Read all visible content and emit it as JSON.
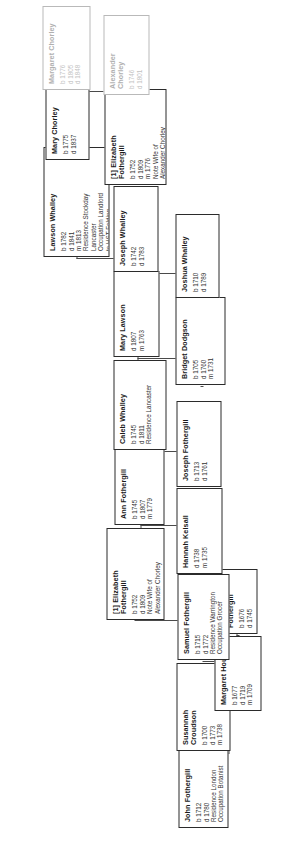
{
  "chart": {
    "type": "genealogy-family-tree",
    "orientation": "rotated-90-ccw"
  },
  "nodes": [
    {
      "id": "john-fothergill-1712",
      "name": "John Fothergill",
      "facts": "b  1712\nd  1780\nResidence  London\nOccupation  Botanist",
      "faded": false,
      "x": 22,
      "y": 178,
      "w": 86,
      "h": 50
    },
    {
      "id": "susannah-croudson",
      "name": "Susannah\nCroudson",
      "facts": "b  1700\nd  1773\nm  1738",
      "faded": false,
      "x": 99,
      "y": 176,
      "w": 88,
      "h": 54
    },
    {
      "id": "margaret-hough",
      "name": "Margaret Hough",
      "facts": "b  1677\nd  1719\nm  1709",
      "faded": false,
      "x": 139,
      "y": 214,
      "w": 75,
      "h": 47
    },
    {
      "id": "john-fothergill-1676",
      "name": "John Fothergill",
      "facts": "b  1676\nd  1745",
      "faded": false,
      "x": 216,
      "y": 213,
      "w": 65,
      "h": 44
    },
    {
      "id": "samuel-fothergill",
      "name": "Samuel Fothergill",
      "facts": "b  1715\nd  1772\nResidence  Warrington\nOccupation  Grocer",
      "faded": false,
      "x": 190,
      "y": 177,
      "w": 86,
      "h": 52
    },
    {
      "id": "elizabeth-fothergill-1752",
      "name": "[1] Elizabeth\nFothergill",
      "facts": "b  1752\nd  1809\nNote  Wife of\nAlexander Chorley",
      "faded": false,
      "x": 230,
      "y": 106,
      "w": 92,
      "h": 58
    },
    {
      "id": "hannah-kelsall",
      "name": "Hannah Kelsall",
      "facts": "d  1738\nm  1735",
      "faded": false,
      "x": 276,
      "y": 176,
      "w": 86,
      "h": 46
    },
    {
      "id": "joseph-fothergill-1713",
      "name": "Joseph Fothergill",
      "facts": "b  1713\nd  1761",
      "faded": false,
      "x": 363,
      "y": 176,
      "w": 86,
      "h": 45
    },
    {
      "id": "ann-fothergill",
      "name": "Ann Fothergill",
      "facts": "b  1745\nd  1807\nm  1779",
      "faded": false,
      "x": 325,
      "y": 114,
      "w": 85,
      "h": 50
    },
    {
      "id": "caleb-whalley",
      "name": "Caleb Whalley",
      "facts": "b  1745\nd  1811\nResidence  Lancaster",
      "faded": false,
      "x": 400,
      "y": 113,
      "w": 90,
      "h": 53
    },
    {
      "id": "bridget-dodgson",
      "name": "Bridget Dodgson",
      "facts": "b  1705\nd  1760\nm  1731",
      "faded": false,
      "x": 465,
      "y": 175,
      "w": 88,
      "h": 50
    },
    {
      "id": "mary-lawson",
      "name": "Mary Lawson",
      "facts": "d  1807\nm  1763",
      "faded": false,
      "x": 493,
      "y": 113,
      "w": 86,
      "h": 46
    },
    {
      "id": "joshua-whalley",
      "name": "Joshua Whalley",
      "facts": "b  1710\nd  1789",
      "faded": false,
      "x": 552,
      "y": 175,
      "w": 84,
      "h": 44
    },
    {
      "id": "joseph-whalley",
      "name": "Joseph Whalley",
      "facts": "b  1742\nd  1783",
      "faded": false,
      "x": 578,
      "y": 113,
      "w": 86,
      "h": 45
    },
    {
      "id": "lawson-whalley",
      "name": "Lawson Whalley",
      "facts": "b  1782\nd  1841\nm  1813\nResidence  Stockday\nLancaster\nOccupation  Landlord\nto HST Folding",
      "faded": false,
      "x": 593,
      "y": 43,
      "w": 110,
      "h": 66
    },
    {
      "id": "elizabeth-fothergill-lower",
      "name": "[1] Elizabeth\nFothergill",
      "facts": "b  1752\nd  1809\nm  1776\nNote  Wife of\nAlexander Chorley",
      "faded": false,
      "x": 665,
      "y": 104,
      "w": 96,
      "h": 62
    },
    {
      "id": "mary-chorley",
      "name": "Mary Chorley",
      "facts": "b  1775\nd  1837",
      "faded": false,
      "x": 690,
      "y": 45,
      "w": 84,
      "h": 44
    },
    {
      "id": "alexander-chorley",
      "name": "Alexander\nChorley",
      "facts": "b  1746\nd  1801",
      "faded": true,
      "x": 755,
      "y": 103,
      "w": 80,
      "h": 46
    },
    {
      "id": "margaret-chorley",
      "name": "Margaret Chorley",
      "facts": "b  1776\nd  1805\nd  1848",
      "faded": true,
      "x": 760,
      "y": 42,
      "w": 84,
      "h": 48
    }
  ],
  "connectors": [
    {
      "o": "v",
      "x": 96,
      "y": 202,
      "len": 26
    },
    {
      "o": "h",
      "x": 96,
      "y": 228,
      "len": 45
    },
    {
      "o": "v",
      "x": 141,
      "y": 228,
      "len": 12
    },
    {
      "o": "v",
      "x": 188,
      "y": 202,
      "len": 12
    },
    {
      "o": "h",
      "x": 188,
      "y": 214,
      "len": 4
    },
    {
      "o": "v",
      "x": 214,
      "y": 236,
      "len": 3
    },
    {
      "o": "h",
      "x": 214,
      "y": 236,
      "len": 3
    },
    {
      "o": "v",
      "x": 229,
      "y": 134,
      "len": 44
    },
    {
      "o": "h",
      "x": 229,
      "y": 178,
      "len": 2
    },
    {
      "o": "v",
      "x": 274,
      "y": 202,
      "len": 10
    },
    {
      "o": "h",
      "x": 274,
      "y": 200,
      "len": 3
    },
    {
      "o": "v",
      "x": 324,
      "y": 140,
      "len": 37
    },
    {
      "o": "h",
      "x": 322,
      "y": 140,
      "len": 4
    },
    {
      "o": "v",
      "x": 361,
      "y": 200,
      "len": 4
    },
    {
      "o": "v",
      "x": 398,
      "y": 140,
      "len": 38
    },
    {
      "o": "h",
      "x": 398,
      "y": 140,
      "len": 3
    },
    {
      "o": "v",
      "x": 463,
      "y": 200,
      "len": 3
    },
    {
      "o": "v",
      "x": 491,
      "y": 137,
      "len": 40
    },
    {
      "o": "h",
      "x": 489,
      "y": 137,
      "len": 4
    },
    {
      "o": "v",
      "x": 550,
      "y": 198,
      "len": 3
    },
    {
      "o": "v",
      "x": 576,
      "y": 136,
      "len": 40
    },
    {
      "o": "v",
      "x": 591,
      "y": 76,
      "len": 38
    },
    {
      "o": "h",
      "x": 591,
      "y": 76,
      "len": 3
    },
    {
      "o": "v",
      "x": 663,
      "y": 135,
      "len": 4
    },
    {
      "o": "v",
      "x": 688,
      "y": 67,
      "len": 38
    },
    {
      "o": "v",
      "x": 753,
      "y": 126,
      "len": 4
    },
    {
      "o": "v",
      "x": 758,
      "y": 66,
      "len": 38
    }
  ]
}
